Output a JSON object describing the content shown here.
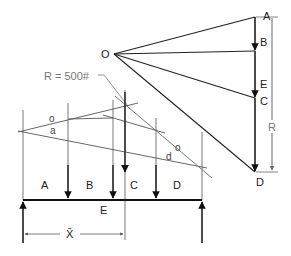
{
  "diagram": {
    "type": "funicular-polygon-force-diagram",
    "force_polygon": {
      "pole_label": "O",
      "points": [
        {
          "label": "A"
        },
        {
          "label": "B"
        },
        {
          "label": "E"
        },
        {
          "label": "C"
        },
        {
          "label": "D"
        }
      ],
      "resultant_label": "R"
    },
    "resultant_note": "R = 500#",
    "funicular": {
      "string_labels": [
        "o",
        "a",
        "d",
        "o"
      ]
    },
    "beam": {
      "space_labels": [
        "A",
        "B",
        "C",
        "D"
      ],
      "below_label": "E",
      "dimension_label": "X̄"
    }
  }
}
